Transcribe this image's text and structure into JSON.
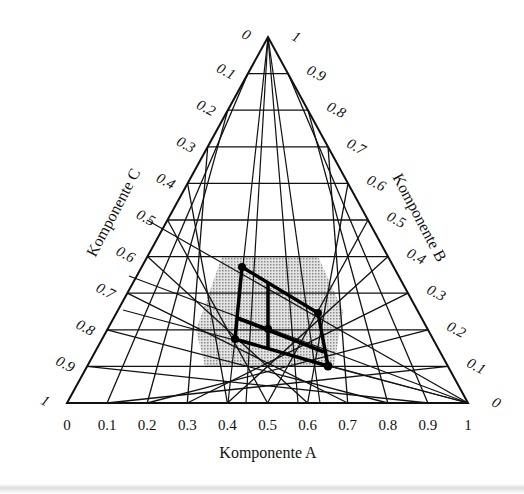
{
  "diagram": {
    "type": "ternary-phase-diagram",
    "axes": {
      "A": {
        "label": "Komponente A",
        "ticks": [
          "0",
          "0.1",
          "0.2",
          "0.3",
          "0.4",
          "0.5",
          "0.6",
          "0.7",
          "0.8",
          "0.9",
          "1"
        ]
      },
      "B": {
        "label": "Komponente B",
        "ticks": [
          "0",
          "0.1",
          "0.2",
          "0.3",
          "0.4",
          "0.5",
          "0.6",
          "0.7",
          "0.8",
          "0.9",
          "1"
        ]
      },
      "C": {
        "label": "Komponente C",
        "ticks": [
          "0",
          "0.1",
          "0.2",
          "0.3",
          "0.4",
          "0.5",
          "0.6",
          "0.7",
          "0.8",
          "0.9",
          "1"
        ]
      }
    },
    "grid_divisions": 10,
    "colors": {
      "line": "#111111",
      "shade": "#c8c8c8",
      "background": "#ffffff"
    }
  }
}
